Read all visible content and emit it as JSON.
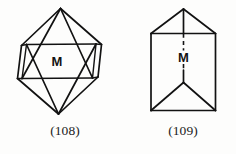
{
  "page": {
    "background_color": "#fdfdfc",
    "ink_color": "#121212"
  },
  "figures": [
    {
      "id": "108",
      "caption": "(108)",
      "shape_name": "octahedron",
      "face_label": "M",
      "line_style": "solid",
      "description": "Octahedron drawn in clinographic projection with visible edges and rear edges shown; the central front face is lettered M."
    },
    {
      "id": "109",
      "caption": "(109)",
      "shape_name": "triangular-prism",
      "face_label": "M",
      "line_style": "solid-with-dashed-hidden-edge",
      "description": "Vertical triangular prism seen in clinographic projection; front face lettered M with a dashed hidden vertical edge running through it."
    }
  ],
  "labels": {
    "m_left": "M",
    "m_right": "M",
    "caption_left": "(108)",
    "caption_right": "(109)"
  }
}
